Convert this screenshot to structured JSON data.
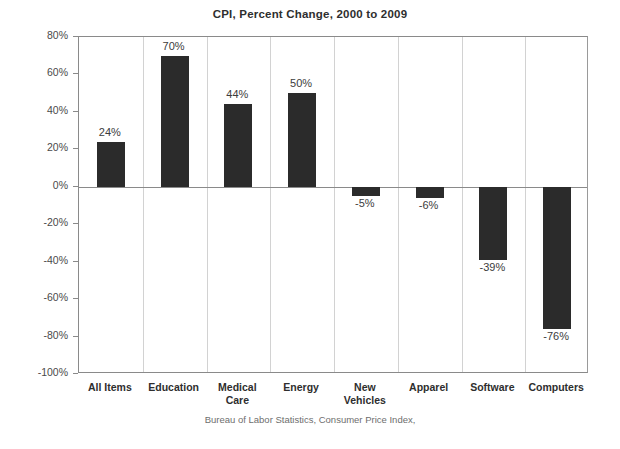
{
  "chart_data": {
    "type": "bar",
    "title": "CPI, Percent Change,  2000 to 2009",
    "xlabel": "",
    "ylabel": "",
    "categories": [
      "All Items",
      "Education",
      "Medical\nCare",
      "Energy",
      "New\nVehicles",
      "Apparel",
      "Software",
      "Computers"
    ],
    "values": [
      24,
      70,
      44,
      50,
      -5,
      -6,
      -39,
      -76
    ],
    "value_labels": [
      "24%",
      "70%",
      "44%",
      "50%",
      "-5%",
      "-6%",
      "-39%",
      "-76%"
    ],
    "ylim": [
      -100,
      80
    ],
    "ytick_values": [
      80,
      60,
      40,
      20,
      0,
      -20,
      -40,
      -60,
      -80,
      -100
    ],
    "ytick_labels": [
      "80%",
      "60%",
      "40%",
      "20%",
      "0%",
      "-20%",
      "-40%",
      "-60%",
      "-80%",
      "-100%"
    ],
    "grid": "vertical",
    "legend": "none",
    "bar_color": "#2b2b2b",
    "source_note": "Bureau of Labor Statistics, Consumer Price Index,"
  }
}
